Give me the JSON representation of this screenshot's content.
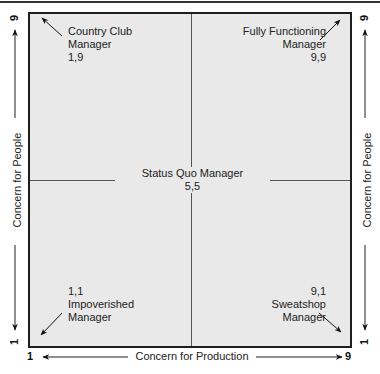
{
  "diagram": {
    "x_axis": {
      "label": "Concern for Production",
      "min": "1",
      "max": "9"
    },
    "y_axis_left": {
      "label": "Concern for People",
      "min": "1",
      "max": "9"
    },
    "y_axis_right": {
      "label": "Concern for People",
      "min": "1",
      "max": "9"
    },
    "quadrants": {
      "top_left": {
        "line1": "Country Club",
        "line2": "Manager",
        "coords": "1,9"
      },
      "top_right": {
        "line1": "Fully Functioning",
        "line2": "Manager",
        "coords": "9,9"
      },
      "bottom_left": {
        "coords": "1,1",
        "line1": "Impoverished",
        "line2": "Manager"
      },
      "bottom_right": {
        "coords": "9,1",
        "line1": "Sweatshop",
        "line2": "Manager"
      },
      "center": {
        "line1": "Status Quo Manager",
        "coords": "5,5"
      }
    },
    "colors": {
      "grid_fill": "#e9e9e9",
      "border": "#1e1e1e",
      "line": "#555555"
    }
  }
}
